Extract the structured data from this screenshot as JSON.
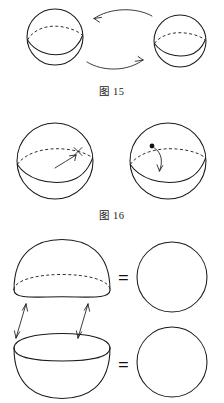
{
  "page": {
    "background_color": "#ffffff",
    "ink_color": "#1a1a1a",
    "width": 224,
    "height": 403
  },
  "figures": [
    {
      "id": "figure-15",
      "caption": "图 15",
      "caption_label": "图",
      "caption_number": "15",
      "description": "Two spheres with equator great circles, connected by two curved arrows forming a rotation cycle",
      "shapes": [
        {
          "name": "sphere-left",
          "cx": 55,
          "cy": 37,
          "r": 28,
          "equator_back": "dashed",
          "equator_front": "solid"
        },
        {
          "name": "sphere-right",
          "cx": 180,
          "cy": 41,
          "r": 26,
          "equator_back": "dashed",
          "equator_front": "solid"
        }
      ],
      "arrows": [
        {
          "name": "arrow-top-left",
          "direction": "left",
          "style": "curved"
        },
        {
          "name": "arrow-bottom-right",
          "direction": "right",
          "style": "curved"
        }
      ]
    },
    {
      "id": "figure-16",
      "caption": "图 16",
      "caption_label": "图",
      "caption_number": "16",
      "description": "Two spheres with equator great circles; left has a straight arrow crossing the equator with an x mark, right has a point with a curved arrow dropping through the equator",
      "shapes": [
        {
          "name": "sphere-left",
          "cx": 55,
          "cy": 161,
          "r": 38,
          "equator_back": "dashed",
          "equator_front": "solid"
        },
        {
          "name": "sphere-right",
          "cx": 168,
          "cy": 161,
          "r": 38,
          "equator_back": "dashed",
          "equator_front": "solid"
        }
      ],
      "marks": [
        {
          "name": "cross-mark",
          "symbol": "x"
        },
        {
          "name": "point-dot",
          "symbol": "dot"
        }
      ],
      "arrows": [
        {
          "name": "arrow-up-right",
          "direction": "up-right",
          "style": "straight"
        },
        {
          "name": "arrow-down",
          "direction": "down",
          "style": "curved"
        }
      ]
    },
    {
      "id": "figure-17",
      "caption": "",
      "description": "Upper hemisphere dome and lower hemisphere bowl separated by double-headed arrows; each equals a circle",
      "shapes": [
        {
          "name": "upper-hemisphere-dome",
          "cx": 62,
          "cy": 290,
          "rx": 50,
          "ry": 42,
          "rim": "dashed-back-solid-front"
        },
        {
          "name": "lower-hemisphere-bowl",
          "cx": 62,
          "cy": 348,
          "rx": 50,
          "ry": 42,
          "rim": "solid-full-ellipse"
        },
        {
          "name": "circle-top-right",
          "cx": 172,
          "cy": 277,
          "r": 35
        },
        {
          "name": "circle-bottom-right",
          "cx": 172,
          "cy": 362,
          "r": 35
        }
      ],
      "arrows": [
        {
          "name": "double-arrow-left",
          "direction": "both",
          "style": "straight"
        },
        {
          "name": "double-arrow-right",
          "direction": "both",
          "style": "straight"
        }
      ],
      "equals_top": "=",
      "equals_bottom": "="
    }
  ]
}
